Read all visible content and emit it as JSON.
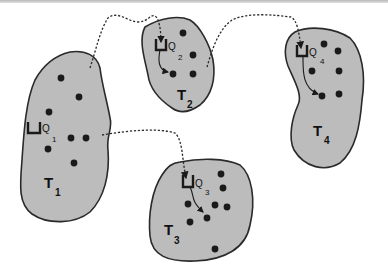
{
  "diagram": {
    "title": "",
    "regions": [
      {
        "id": "T1",
        "label": "T",
        "subscript": "1",
        "queue_label": "Q",
        "queue_subscript": "1"
      },
      {
        "id": "T2",
        "label": "T",
        "subscript": "2",
        "queue_label": "Q",
        "queue_subscript": "2"
      },
      {
        "id": "T3",
        "label": "T",
        "subscript": "3",
        "queue_label": "Q",
        "queue_subscript": "3"
      },
      {
        "id": "T4",
        "label": "T",
        "subscript": "4",
        "queue_label": "Q",
        "queue_subscript": "4"
      }
    ],
    "connections": [
      {
        "from": "T1",
        "to": "T2",
        "style": "dashed-arrow"
      },
      {
        "from": "T1",
        "to": "T3",
        "style": "dashed-arrow"
      },
      {
        "from": "T2",
        "to": "T4",
        "style": "dashed-arrow"
      }
    ],
    "colors": {
      "region_fill": "#bcbcbc",
      "outline": "#2a2a2a",
      "dot": "#1a1a1a",
      "background": "#ffffff"
    }
  }
}
